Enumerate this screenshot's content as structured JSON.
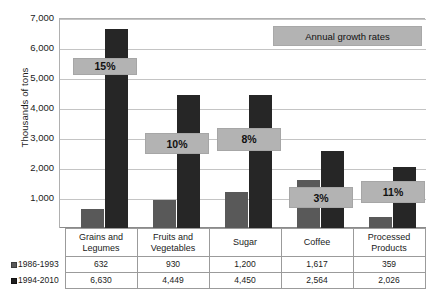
{
  "axis": {
    "ylabel": "Thousands of tons",
    "yticks": [
      "7,000",
      "6,000",
      "5,000",
      "4,000",
      "3,000",
      "2,000",
      "1,000"
    ]
  },
  "legend": {
    "growth_box_label": "Annual growth rates"
  },
  "series_keys": [
    {
      "label": "1986-1993",
      "swatch": "square-gray-icon"
    },
    {
      "label": "1994-2010",
      "swatch": "square-black-icon"
    }
  ],
  "table": {
    "row_headers": [
      "1986-1993",
      "1994-2010"
    ],
    "columns": [
      "Grains and Legumes",
      "Fruits and Vegetables",
      "Sugar",
      "Coffee",
      "Processed Products"
    ],
    "rows": [
      [
        "632",
        "930",
        "1,200",
        "1,617",
        "359"
      ],
      [
        "6,630",
        "4,449",
        "4,450",
        "2,564",
        "2,026"
      ]
    ]
  },
  "growth_labels": [
    "15%",
    "10%",
    "8%",
    "3%",
    "11%"
  ],
  "colors": {
    "series_1986_1993": "#595959",
    "series_1994_2010": "#262626",
    "growth_box": "#b3b3b3",
    "gridline": "#c4c4c4",
    "background": "#ffffff"
  },
  "chart_data": {
    "type": "bar",
    "title": "",
    "xlabel": "",
    "ylabel": "Thousands of tons",
    "ylim": [
      0,
      7000
    ],
    "ytick_values": [
      0,
      1000,
      2000,
      3000,
      4000,
      5000,
      6000,
      7000
    ],
    "grid": true,
    "legend_position": "bottom-table",
    "categories": [
      "Grains and Legumes",
      "Fruits and Vegetables",
      "Sugar",
      "Coffee",
      "Processed Products"
    ],
    "series": [
      {
        "name": "1986-1993",
        "values": [
          632,
          930,
          1200,
          1617,
          359
        ],
        "color": "#595959"
      },
      {
        "name": "1994-2010",
        "values": [
          6630,
          4449,
          4450,
          2564,
          2026
        ],
        "color": "#262626"
      }
    ],
    "annotations": [
      {
        "category": "Grains and Legumes",
        "text": "15%",
        "value_span": [
          5150,
          5700
        ]
      },
      {
        "category": "Fruits and Vegetables",
        "text": "10%",
        "value_span": [
          2500,
          3200
        ]
      },
      {
        "category": "Sugar",
        "text": "8%",
        "value_span": [
          2600,
          3380
        ]
      },
      {
        "category": "Coffee",
        "text": "3%",
        "value_span": [
          700,
          1400
        ]
      },
      {
        "category": "Processed Products",
        "text": "11%",
        "value_span": [
          860,
          1600
        ]
      }
    ],
    "legend_annotation": "Annual growth rates"
  }
}
